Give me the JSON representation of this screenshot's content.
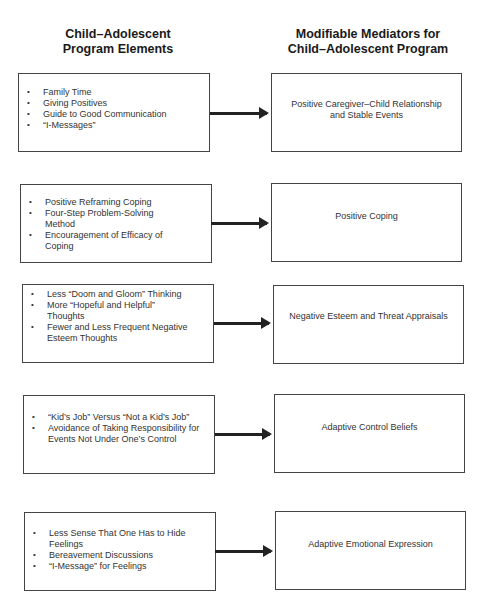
{
  "headers": {
    "left_line1": "Child–Adolescent",
    "left_line2": "Program Elements",
    "right_line1": "Modifiable Mediators for",
    "right_line2": "Child–Adolescent Program"
  },
  "rows": [
    {
      "elements": [
        "Family Time",
        "Giving Positives",
        "Guide to Good Communication",
        "“I-Messages”"
      ],
      "mediator_line1": "Positive Caregiver–Child Relationship",
      "mediator_line2": "and Stable Events"
    },
    {
      "elements": [
        "Positive Reframing Coping",
        "Four-Step Problem-Solving Method",
        "Encouragement of Efficacy of Coping"
      ],
      "mediator_line1": "Positive Coping",
      "mediator_line2": ""
    },
    {
      "elements": [
        "Less “Doom and Gloom” Thinking",
        "More “Hopeful and Helpful” Thoughts",
        "Fewer and Less Frequent Negative Esteem Thoughts"
      ],
      "mediator_line1": "Negative Esteem and Threat Appraisals",
      "mediator_line2": ""
    },
    {
      "elements": [
        "“Kid’s Job” Versus “Not a Kid’s Job”",
        "Avoidance of Taking Responsibility for Events Not Under One’s Control"
      ],
      "mediator_line1": "Adaptive Control Beliefs",
      "mediator_line2": ""
    },
    {
      "elements": [
        "Less Sense That One Has to Hide Feelings",
        "Bereavement Discussions",
        "“I-Message” for Feelings"
      ],
      "mediator_line1": "Adaptive Emotional Expression",
      "mediator_line2": ""
    }
  ]
}
